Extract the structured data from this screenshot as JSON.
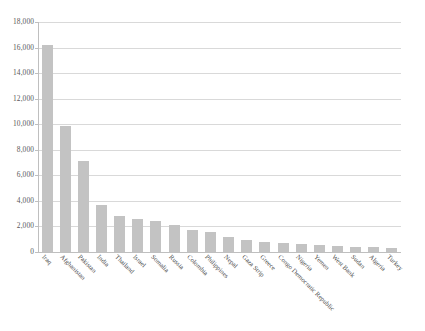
{
  "chart_data": {
    "type": "bar",
    "title": "",
    "subtitle": "",
    "xlabel": "",
    "ylabel": "",
    "ylim": [
      0,
      18000
    ],
    "ytick_values": [
      0,
      2000,
      4000,
      6000,
      8000,
      10000,
      12000,
      14000,
      16000,
      18000
    ],
    "ytick_labels": [
      "0",
      "2,000",
      "4,000",
      "6,000",
      "8,000",
      "10,000",
      "12,000",
      "14,000",
      "16,000",
      "18,000"
    ],
    "grid": true,
    "grid_axis": "y",
    "legend": false,
    "legend_position": "none",
    "bar_color": "#c3c3c3",
    "gridline_color": "#d9d9d9",
    "axis_color": "#bfbfbf",
    "categories": [
      "Iraq",
      "Afghanistan",
      "Pakistan",
      "India",
      "Thailand",
      "Israel",
      "Somalia",
      "Russia",
      "Colombia",
      "Philippines",
      "Nepal",
      "Gaza Strip",
      "Greece",
      "Congo Democratic Republic",
      "Nigeria",
      "Yemen",
      "West Bank",
      "Sudan",
      "Algeria",
      "Turkey"
    ],
    "values": [
      16200,
      9900,
      7100,
      3650,
      2800,
      2600,
      2400,
      2150,
      1700,
      1600,
      1150,
      950,
      800,
      700,
      620,
      520,
      470,
      420,
      380,
      350
    ]
  }
}
